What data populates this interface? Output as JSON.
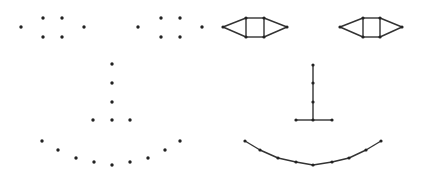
{
  "diagram": {
    "title": "",
    "background": "#ffffff",
    "node_color": "#222222",
    "edge_color": "#333333",
    "panels": [
      {
        "name": "points-only-face",
        "show_edges": false,
        "nodes": [
          [
            21,
            27
          ],
          [
            43,
            18
          ],
          [
            62,
            18
          ],
          [
            43,
            37
          ],
          [
            62,
            37
          ],
          [
            84,
            27
          ],
          [
            138,
            27
          ],
          [
            161,
            18
          ],
          [
            180,
            18
          ],
          [
            161,
            37
          ],
          [
            180,
            37
          ],
          [
            202,
            27
          ],
          [
            112,
            64
          ],
          [
            112,
            83
          ],
          [
            112,
            102
          ],
          [
            93,
            120
          ],
          [
            112,
            120
          ],
          [
            130,
            120
          ],
          [
            42,
            141
          ],
          [
            58,
            150
          ],
          [
            76,
            158
          ],
          [
            94,
            162
          ],
          [
            112,
            165
          ],
          [
            130,
            162
          ],
          [
            148,
            158
          ],
          [
            165,
            150
          ],
          [
            180,
            141
          ]
        ],
        "edges": []
      },
      {
        "name": "connected-graph-face",
        "show_edges": true,
        "nodes": [
          [
            223,
            27
          ],
          [
            246,
            18
          ],
          [
            264,
            18
          ],
          [
            246,
            37
          ],
          [
            264,
            37
          ],
          [
            287,
            27
          ],
          [
            340,
            27
          ],
          [
            363,
            18
          ],
          [
            380,
            18
          ],
          [
            363,
            37
          ],
          [
            380,
            37
          ],
          [
            402,
            27
          ],
          [
            313,
            65
          ],
          [
            313,
            83
          ],
          [
            313,
            102
          ],
          [
            296,
            120
          ],
          [
            313,
            120
          ],
          [
            332,
            120
          ],
          [
            245,
            141
          ],
          [
            260,
            150
          ],
          [
            278,
            158
          ],
          [
            296,
            162
          ],
          [
            313,
            165
          ],
          [
            332,
            162
          ],
          [
            349,
            158
          ],
          [
            366,
            150
          ],
          [
            381,
            141
          ]
        ],
        "edges": [
          [
            0,
            1
          ],
          [
            1,
            2
          ],
          [
            2,
            5
          ],
          [
            0,
            3
          ],
          [
            3,
            4
          ],
          [
            4,
            5
          ],
          [
            1,
            3
          ],
          [
            2,
            4
          ],
          [
            6,
            7
          ],
          [
            7,
            8
          ],
          [
            8,
            11
          ],
          [
            6,
            9
          ],
          [
            9,
            10
          ],
          [
            10,
            11
          ],
          [
            7,
            9
          ],
          [
            8,
            10
          ],
          [
            12,
            13
          ],
          [
            13,
            14
          ],
          [
            14,
            16
          ],
          [
            15,
            16
          ],
          [
            16,
            17
          ],
          [
            18,
            19
          ],
          [
            19,
            20
          ],
          [
            20,
            21
          ],
          [
            21,
            22
          ],
          [
            22,
            23
          ],
          [
            23,
            24
          ],
          [
            24,
            25
          ],
          [
            25,
            26
          ]
        ]
      }
    ]
  }
}
